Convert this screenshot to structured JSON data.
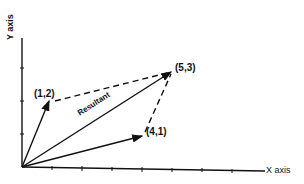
{
  "diagram": {
    "axes": {
      "x_label": "X axis",
      "y_label": "Y axis"
    },
    "origin": [
      0,
      0
    ],
    "vectors": [
      {
        "name": "vector-a",
        "to": [
          1,
          2
        ],
        "label": "(1,2)"
      },
      {
        "name": "vector-b",
        "to": [
          4,
          1
        ],
        "label": "(4,1)"
      },
      {
        "name": "resultant",
        "to": [
          5,
          3
        ],
        "label": "(5,3)",
        "caption": "Resultant"
      }
    ],
    "dashed_lines": [
      {
        "from": [
          1,
          2
        ],
        "to": [
          5,
          3
        ]
      },
      {
        "from": [
          4,
          1
        ],
        "to": [
          5,
          3
        ]
      }
    ],
    "colors": {
      "ink": "#111111",
      "background": "#ffffff"
    }
  }
}
